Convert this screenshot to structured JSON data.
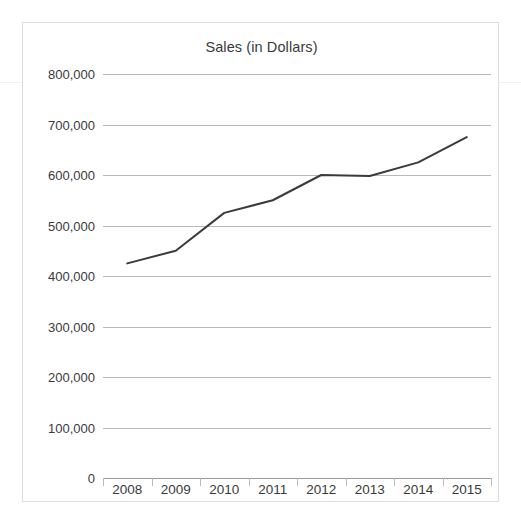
{
  "page": {
    "clipped_top_text": "",
    "background_color": "#ffffff"
  },
  "chart_frame": {
    "border_color": "#dcdcde"
  },
  "chart_data": {
    "type": "line",
    "title": "Sales (in Dollars)",
    "xlabel": "",
    "ylabel": "",
    "categories": [
      "2008",
      "2009",
      "2010",
      "2011",
      "2012",
      "2013",
      "2014",
      "2015"
    ],
    "values": [
      425000,
      450000,
      525000,
      550000,
      600000,
      598000,
      625000,
      675000
    ],
    "series": [
      {
        "name": "Sales",
        "color": "#3b3b3d",
        "values": [
          425000,
          450000,
          525000,
          550000,
          600000,
          598000,
          625000,
          675000
        ]
      }
    ],
    "ylim": [
      0,
      800000
    ],
    "ytick_values": [
      0,
      100000,
      200000,
      300000,
      400000,
      500000,
      600000,
      700000,
      800000
    ],
    "ytick_labels": [
      "0",
      "100,000",
      "200,000",
      "300,000",
      "400,000",
      "500,000",
      "600,000",
      "700,000",
      "800,000"
    ],
    "grid": true,
    "gridline_color": "#b9b9bb",
    "legend": false,
    "legend_position": "none",
    "line_color": "#3b3b3d",
    "line_width": 2,
    "markers": false
  }
}
